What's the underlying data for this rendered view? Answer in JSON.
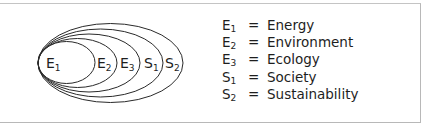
{
  "diagram": {
    "type": "nested-ellipses",
    "ellipses": [
      {
        "id": "E1",
        "letter": "E",
        "sub": "1",
        "label_x": 46,
        "cx": 66.5,
        "rx": 28.5,
        "ry": 21
      },
      {
        "id": "E2",
        "letter": "E",
        "sub": "2",
        "label_x": 97,
        "cx": 77.5,
        "rx": 39.5,
        "ry": 24.5
      },
      {
        "id": "E3",
        "letter": "E",
        "sub": "3",
        "label_x": 120,
        "cx": 89,
        "rx": 51,
        "ry": 29
      },
      {
        "id": "S1",
        "letter": "S",
        "sub": "1",
        "label_x": 144,
        "cx": 100.5,
        "rx": 62.5,
        "ry": 34
      },
      {
        "id": "S2",
        "letter": "S",
        "sub": "2",
        "label_x": 165,
        "cx": 110.5,
        "rx": 72.5,
        "ry": 39.5
      }
    ],
    "stroke_color": "#2a2a2a",
    "background": "#ffffff",
    "border_color": "#b8b8b8"
  },
  "legend": {
    "items": [
      {
        "letter": "E",
        "sub": "1",
        "equals": "=",
        "term": "Energy"
      },
      {
        "letter": "E",
        "sub": "2",
        "equals": "=",
        "term": "Environment"
      },
      {
        "letter": "E",
        "sub": "3",
        "equals": "=",
        "term": "Ecology"
      },
      {
        "letter": "S",
        "sub": "1",
        "equals": "=",
        "term": "Society"
      },
      {
        "letter": "S",
        "sub": "2",
        "equals": "=",
        "term": "Sustainability"
      }
    ]
  }
}
